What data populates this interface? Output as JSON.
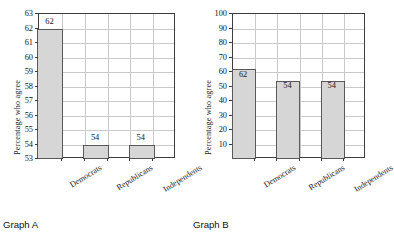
{
  "figure": {
    "background": "#ffffff",
    "bar_fill": "#d6d6d6",
    "bar_stroke": "#595959",
    "grid_color": "#c9c9c9",
    "axis_color": "#3d3d3d"
  },
  "graph_a": {
    "caption": "Graph A",
    "ylabel": "Percentage who agree",
    "tick_labels": [
      "53",
      "54",
      "55",
      "56",
      "57",
      "58",
      "59",
      "60",
      "61",
      "62",
      "63"
    ],
    "categories": [
      "Democrats",
      "Republicans",
      "Independents"
    ],
    "bar_labels": [
      "62",
      "54",
      "54"
    ]
  },
  "graph_b": {
    "caption": "Graph B",
    "ylabel": "Percentage who agree",
    "tick_labels": [
      "10",
      "20",
      "30",
      "40",
      "50",
      "60",
      "70",
      "80",
      "90",
      "100"
    ],
    "categories": [
      "Democrats",
      "Republicans",
      "Independents"
    ],
    "bar_labels": [
      "62",
      "54",
      "54"
    ]
  },
  "chart_data": [
    {
      "type": "bar",
      "id": "Graph A",
      "title": "Graph A",
      "xlabel": "",
      "ylabel": "Percentage who agree",
      "categories": [
        "Democrats",
        "Republicans",
        "Independents"
      ],
      "values": [
        62,
        54,
        54
      ],
      "data_labels": [
        "62",
        "54",
        "54"
      ],
      "data_label_position": "above-bar",
      "ylim": [
        53,
        63
      ],
      "ytick_step": 1,
      "yticks": [
        53,
        54,
        55,
        56,
        57,
        58,
        59,
        60,
        61,
        62,
        63
      ],
      "grid": true,
      "legend": "none",
      "note": "Truncated y-axis starting at 53 exaggerates the difference between bars"
    },
    {
      "type": "bar",
      "id": "Graph B",
      "title": "Graph B",
      "xlabel": "",
      "ylabel": "Percentage who agree",
      "categories": [
        "Democrats",
        "Republicans",
        "Independents"
      ],
      "values": [
        62,
        54,
        54
      ],
      "data_labels": [
        "62",
        "54",
        "54"
      ],
      "data_label_position": "inside-bar-top",
      "ylim": [
        0,
        100
      ],
      "ytick_step": 10,
      "yticks": [
        10,
        20,
        30,
        40,
        50,
        60,
        70,
        80,
        90,
        100
      ],
      "grid": true,
      "legend": "none",
      "note": "Full 0-100 y-axis shows the true proportional difference between bars"
    }
  ]
}
